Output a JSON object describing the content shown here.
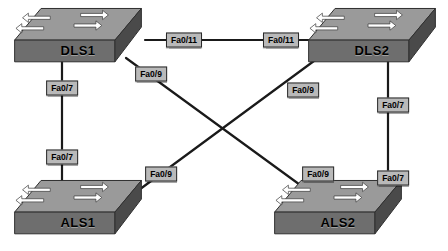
{
  "diagram": {
    "background_color": "#ffffff",
    "link_color": "#1a1a1a",
    "label_box_color": "#b9b9b9",
    "label_border_color": "#2a2a2a",
    "device_top_color": "#9a9a9a",
    "device_front_color": "#6e6e6e",
    "device_side_color": "#4a4a4a",
    "arrow_color": "#ffffff"
  },
  "devices": [
    {
      "id": "dls1",
      "name": "DLS1",
      "role": "distribution-switch",
      "x": 12,
      "y": 6,
      "w": 132,
      "h": 62
    },
    {
      "id": "dls2",
      "name": "DLS2",
      "role": "distribution-switch",
      "x": 306,
      "y": 6,
      "w": 132,
      "h": 62
    },
    {
      "id": "als1",
      "name": "ALS1",
      "role": "access-switch",
      "x": 12,
      "y": 178,
      "w": 132,
      "h": 62
    },
    {
      "id": "als2",
      "name": "ALS2",
      "role": "access-switch",
      "x": 272,
      "y": 178,
      "w": 132,
      "h": 62
    }
  ],
  "links": [
    {
      "id": "dls1-dls2",
      "from": "dls1",
      "to": "dls2",
      "x1": 145,
      "y1": 40,
      "x2": 330,
      "y2": 40
    },
    {
      "id": "dls1-als1",
      "from": "dls1",
      "to": "als1",
      "x1": 62,
      "y1": 62,
      "x2": 62,
      "y2": 196
    },
    {
      "id": "dls2-als2",
      "from": "dls2",
      "to": "als2",
      "x1": 388,
      "y1": 62,
      "x2": 388,
      "y2": 196
    },
    {
      "id": "dls1-als2",
      "from": "dls1",
      "to": "als2",
      "x1": 126,
      "y1": 58,
      "x2": 318,
      "y2": 198
    },
    {
      "id": "dls2-als1",
      "from": "dls2",
      "to": "als1",
      "x1": 318,
      "y1": 58,
      "x2": 128,
      "y2": 198
    }
  ],
  "port_labels": [
    {
      "id": "p1",
      "text": "Fa0/11",
      "device": "dls1",
      "link": "dls1-dls2",
      "x": 184,
      "y": 40
    },
    {
      "id": "p2",
      "text": "Fa0/11",
      "device": "dls2",
      "link": "dls1-dls2",
      "x": 281,
      "y": 40
    },
    {
      "id": "p3",
      "text": "Fa0/7",
      "device": "dls1",
      "link": "dls1-als1",
      "x": 62,
      "y": 88
    },
    {
      "id": "p4",
      "text": "Fa0/7",
      "device": "als1",
      "link": "dls1-als1",
      "x": 62,
      "y": 157
    },
    {
      "id": "p5",
      "text": "Fa0/7",
      "device": "dls2",
      "link": "dls2-als2",
      "x": 393,
      "y": 105
    },
    {
      "id": "p6",
      "text": "Fa0/7",
      "device": "als2",
      "link": "dls2-als2",
      "x": 393,
      "y": 178
    },
    {
      "id": "p7",
      "text": "Fa0/9",
      "device": "dls1",
      "link": "dls1-als2",
      "x": 151,
      "y": 74
    },
    {
      "id": "p8",
      "text": "Fa0/9",
      "device": "als2",
      "link": "dls1-als2",
      "x": 318,
      "y": 174
    },
    {
      "id": "p9",
      "text": "Fa0/9",
      "device": "dls2",
      "link": "dls2-als1",
      "x": 303,
      "y": 90
    },
    {
      "id": "p10",
      "text": "Fa0/9",
      "device": "als1",
      "link": "dls2-als1",
      "x": 161,
      "y": 174
    }
  ]
}
